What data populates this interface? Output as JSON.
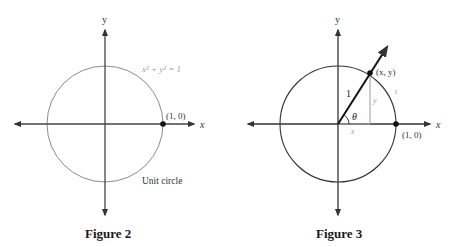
{
  "figure2": {
    "caption": "Figure 2",
    "axis_x_label": "x",
    "axis_y_label": "y",
    "equation": "x² + y² = 1",
    "point_label": "(1, 0)",
    "circle_label": "Unit circle"
  },
  "figure3": {
    "caption": "Figure 3",
    "axis_x_label": "x",
    "axis_y_label": "y",
    "point_xy_label": "(x, y)",
    "point_10_label": "(1, 0)",
    "radius_label": "1",
    "angle_label": "θ",
    "leg_x_label": "x",
    "leg_y_label": "y",
    "arc_label": "t"
  },
  "colors": {
    "axis": "#333333",
    "circle_fig2": "#8a8a8a",
    "circle_fig3": "#333333",
    "gray_text": "#9a9a9a",
    "text": "#222222"
  }
}
